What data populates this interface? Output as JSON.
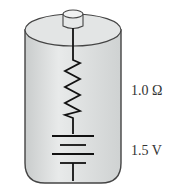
{
  "diagram": {
    "resistor": {
      "label": "1.0 Ω"
    },
    "emf_source": {
      "label": "1.5 V"
    },
    "colors": {
      "body_fill": "#d9dcdc",
      "body_stroke": "#444444",
      "line": "#111111",
      "text": "#333333"
    }
  }
}
